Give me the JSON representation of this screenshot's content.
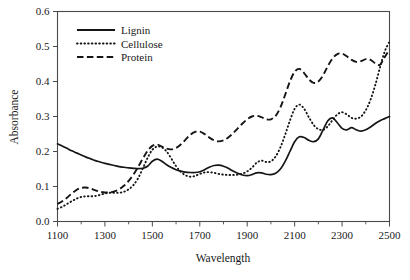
{
  "chart_data": {
    "type": "line",
    "title": "",
    "xlabel": "Wavelength",
    "ylabel": "Absorbance",
    "xlim": [
      1100,
      2500
    ],
    "ylim": [
      0.0,
      0.6
    ],
    "xticks": [
      1100,
      1300,
      1500,
      1700,
      1900,
      2100,
      2300,
      2500
    ],
    "xticklabels": [
      "1100",
      "1300",
      "1500",
      "1700",
      "1900",
      "2100",
      "2300",
      "2500"
    ],
    "xminorticks": [
      1200,
      1400,
      1600,
      1800,
      2000,
      2200,
      2400
    ],
    "yticks": [
      0.0,
      0.1,
      0.2,
      0.3,
      0.4,
      0.5,
      0.6
    ],
    "yticklabels": [
      "0.0",
      "0.1",
      "0.2",
      "0.3",
      "0.4",
      "0.5",
      "0.6"
    ],
    "grid": false,
    "legend_position": "upper-left-inside",
    "legend_entries": [
      "Lignin",
      "Cellulose",
      "Protein"
    ],
    "x": [
      1100,
      1120,
      1140,
      1160,
      1180,
      1200,
      1220,
      1240,
      1260,
      1280,
      1300,
      1320,
      1340,
      1360,
      1380,
      1400,
      1420,
      1440,
      1460,
      1480,
      1500,
      1520,
      1540,
      1560,
      1580,
      1600,
      1620,
      1640,
      1660,
      1680,
      1700,
      1720,
      1740,
      1760,
      1780,
      1800,
      1820,
      1840,
      1860,
      1880,
      1900,
      1920,
      1940,
      1960,
      1980,
      2000,
      2020,
      2040,
      2060,
      2080,
      2100,
      2120,
      2140,
      2160,
      2180,
      2200,
      2220,
      2240,
      2260,
      2280,
      2300,
      2320,
      2340,
      2360,
      2380,
      2400,
      2420,
      2440,
      2460,
      2480,
      2500
    ],
    "series": [
      {
        "name": "Lignin",
        "style": "solid",
        "color": "#151515",
        "values": [
          0.222,
          0.216,
          0.209,
          0.202,
          0.196,
          0.19,
          0.184,
          0.179,
          0.174,
          0.17,
          0.166,
          0.163,
          0.16,
          0.157,
          0.155,
          0.153,
          0.152,
          0.151,
          0.152,
          0.158,
          0.172,
          0.178,
          0.172,
          0.162,
          0.154,
          0.148,
          0.144,
          0.141,
          0.14,
          0.14,
          0.142,
          0.148,
          0.155,
          0.16,
          0.161,
          0.158,
          0.152,
          0.144,
          0.138,
          0.133,
          0.131,
          0.134,
          0.139,
          0.139,
          0.135,
          0.134,
          0.138,
          0.15,
          0.172,
          0.2,
          0.228,
          0.242,
          0.24,
          0.232,
          0.228,
          0.236,
          0.262,
          0.288,
          0.296,
          0.282,
          0.266,
          0.262,
          0.268,
          0.262,
          0.258,
          0.262,
          0.27,
          0.28,
          0.288,
          0.294,
          0.3
        ]
      },
      {
        "name": "Cellulose",
        "style": "dotted",
        "color": "#151515",
        "values": [
          0.036,
          0.042,
          0.05,
          0.058,
          0.065,
          0.07,
          0.072,
          0.072,
          0.073,
          0.076,
          0.08,
          0.082,
          0.082,
          0.082,
          0.085,
          0.092,
          0.104,
          0.124,
          0.152,
          0.182,
          0.205,
          0.214,
          0.212,
          0.2,
          0.18,
          0.158,
          0.142,
          0.132,
          0.128,
          0.13,
          0.136,
          0.14,
          0.141,
          0.139,
          0.136,
          0.134,
          0.133,
          0.133,
          0.134,
          0.137,
          0.143,
          0.154,
          0.168,
          0.174,
          0.17,
          0.172,
          0.186,
          0.212,
          0.248,
          0.288,
          0.322,
          0.334,
          0.322,
          0.298,
          0.276,
          0.264,
          0.262,
          0.272,
          0.29,
          0.306,
          0.312,
          0.306,
          0.296,
          0.294,
          0.3,
          0.318,
          0.348,
          0.39,
          0.44,
          0.486,
          0.514
        ]
      },
      {
        "name": "Protein",
        "style": "dashed",
        "color": "#151515",
        "values": [
          0.05,
          0.058,
          0.068,
          0.08,
          0.09,
          0.096,
          0.097,
          0.094,
          0.089,
          0.085,
          0.083,
          0.083,
          0.086,
          0.092,
          0.102,
          0.116,
          0.134,
          0.156,
          0.18,
          0.202,
          0.216,
          0.22,
          0.214,
          0.208,
          0.206,
          0.21,
          0.22,
          0.234,
          0.248,
          0.256,
          0.257,
          0.25,
          0.24,
          0.232,
          0.229,
          0.232,
          0.24,
          0.252,
          0.266,
          0.28,
          0.292,
          0.3,
          0.302,
          0.298,
          0.292,
          0.292,
          0.302,
          0.326,
          0.362,
          0.4,
          0.428,
          0.436,
          0.424,
          0.406,
          0.396,
          0.4,
          0.418,
          0.444,
          0.466,
          0.478,
          0.48,
          0.472,
          0.462,
          0.456,
          0.458,
          0.464,
          0.462,
          0.452,
          0.448,
          0.47,
          0.492
        ]
      }
    ]
  }
}
